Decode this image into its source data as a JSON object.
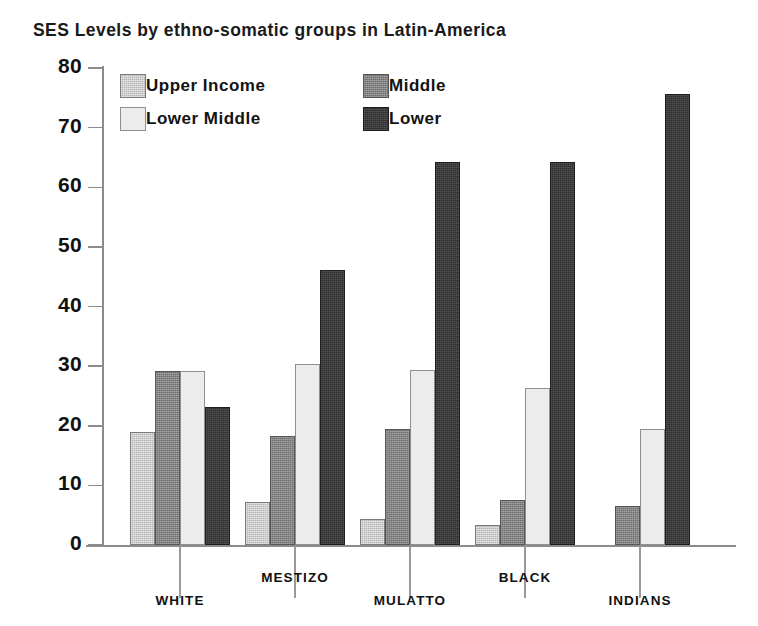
{
  "chart_data": {
    "type": "bar",
    "title": "SES Levels by ethno-somatic groups in Latin-America",
    "xlabel": "",
    "ylabel": "",
    "ylim": [
      0,
      80
    ],
    "yticks": [
      0,
      10,
      20,
      30,
      40,
      50,
      60,
      70,
      80
    ],
    "ytick_labels": [
      "0",
      "10",
      "20",
      "30",
      "40",
      "50",
      "60",
      "70",
      "80"
    ],
    "grid": false,
    "legend_position": "top-left-inside",
    "categories": [
      "WHITE",
      "MESTIZO",
      "MULATTO",
      "BLACK",
      "INDIANS"
    ],
    "series": [
      {
        "name": "Upper Income",
        "color": "#b3b3b3",
        "values": [
          19.0,
          7.2,
          4.4,
          3.4,
          0.0
        ]
      },
      {
        "name": "Middle",
        "color": "#6e6e6e",
        "values": [
          29.1,
          18.3,
          19.4,
          7.5,
          6.6
        ]
      },
      {
        "name": "Lower Middle",
        "color": "#ececec",
        "values": [
          29.1,
          30.3,
          29.4,
          26.4,
          19.5
        ]
      },
      {
        "name": "Lower",
        "color": "#2e2e2e",
        "values": [
          23.2,
          46.2,
          64.2,
          64.3,
          75.6
        ]
      }
    ]
  },
  "legend": {
    "items": [
      {
        "label": "Upper Income",
        "series": "upper"
      },
      {
        "label": "Lower Middle",
        "series": "lowermiddle"
      },
      {
        "label": "Middle",
        "series": "middle"
      },
      {
        "label": "Lower",
        "series": "lower"
      }
    ]
  },
  "colors": {
    "upper_income": "#b3b3b3",
    "middle": "#6e6e6e",
    "lower_middle": "#ececec",
    "lower": "#2e2e2e",
    "axis": "#8c8c8c",
    "text": "#111111",
    "background": "#ffffff"
  }
}
